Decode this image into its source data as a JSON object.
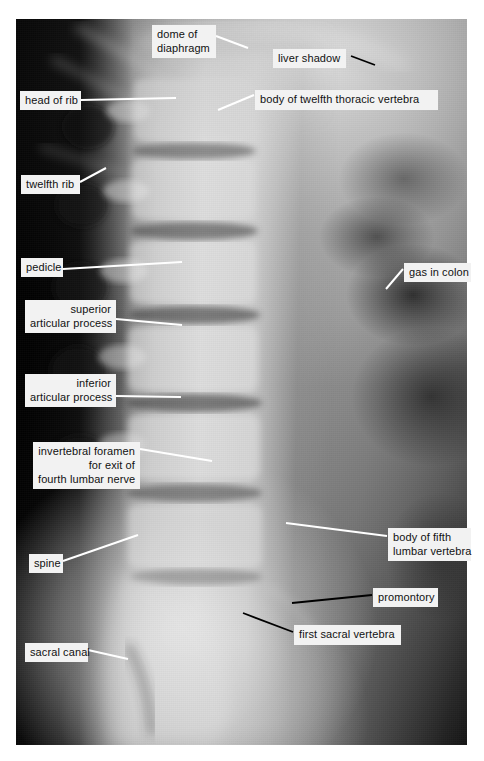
{
  "figure": {
    "kind": "annotated-radiograph",
    "background_color": "#ffffff",
    "label_box_color": "#f2f2f2",
    "label_text_color": "#111111",
    "white_leader_color": "#ffffff",
    "black_leader_color": "#000000"
  },
  "annotations": [
    {
      "id": "dome-of-diaphragm",
      "text": "dome of\ndiaphragm",
      "align": "left",
      "box": {
        "x": 152,
        "y": 25,
        "w": 64,
        "h": 31
      },
      "leader": {
        "from_x": 216,
        "from_y": 36,
        "to_x": 248,
        "to_y": 48,
        "color": "white"
      }
    },
    {
      "id": "liver-shadow",
      "text": "liver shadow",
      "align": "left",
      "box": {
        "x": 273,
        "y": 49,
        "w": 73,
        "h": 19
      },
      "leader": {
        "from_x": 351,
        "from_y": 56,
        "to_x": 375,
        "to_y": 65,
        "color": "black"
      }
    },
    {
      "id": "head-of-rib",
      "text": "head of rib",
      "align": "left",
      "box": {
        "x": 20,
        "y": 91,
        "w": 61,
        "h": 19
      },
      "leader": {
        "from_x": 81,
        "from_y": 100,
        "to_x": 176,
        "to_y": 98,
        "color": "white"
      }
    },
    {
      "id": "body-of-twelfth-thoracic-vertebra",
      "text": "body of twelfth thoracic vertebra",
      "align": "left",
      "box": {
        "x": 255,
        "y": 90,
        "w": 183,
        "h": 20
      },
      "leader": {
        "from_x": 254,
        "from_y": 95,
        "to_x": 218,
        "to_y": 110,
        "color": "white"
      }
    },
    {
      "id": "twelfth-rib",
      "text": "twelfth rib",
      "align": "left",
      "box": {
        "x": 21,
        "y": 175,
        "w": 59,
        "h": 19
      },
      "leader": {
        "from_x": 80,
        "from_y": 182,
        "to_x": 106,
        "to_y": 168,
        "color": "white"
      }
    },
    {
      "id": "pedicle",
      "text": "pedicle",
      "align": "left",
      "box": {
        "x": 21,
        "y": 258,
        "w": 42,
        "h": 19
      },
      "leader": {
        "from_x": 63,
        "from_y": 269,
        "to_x": 182,
        "to_y": 262,
        "color": "white"
      }
    },
    {
      "id": "gas-in-colon",
      "text": "gas in colon",
      "align": "left",
      "box": {
        "x": 404,
        "y": 263,
        "w": 67,
        "h": 19
      },
      "leader": {
        "from_x": 403,
        "from_y": 269,
        "to_x": 386,
        "to_y": 289,
        "color": "white"
      }
    },
    {
      "id": "superior-articular-process",
      "text": "superior\narticular process",
      "align": "right",
      "box": {
        "x": 25,
        "y": 300,
        "w": 91,
        "h": 31
      },
      "leader": {
        "from_x": 116,
        "from_y": 319,
        "to_x": 182,
        "to_y": 325,
        "color": "white"
      }
    },
    {
      "id": "inferior-articular-process",
      "text": "inferior\narticular process",
      "align": "right",
      "box": {
        "x": 25,
        "y": 374,
        "w": 91,
        "h": 31
      },
      "leader": {
        "from_x": 116,
        "from_y": 396,
        "to_x": 181,
        "to_y": 397,
        "color": "white"
      }
    },
    {
      "id": "invertebral-foramen",
      "text": "invertebral foramen\nfor exit of\nfourth lumbar nerve",
      "align": "right",
      "box": {
        "x": 33,
        "y": 442,
        "w": 107,
        "h": 45
      },
      "leader": {
        "from_x": 140,
        "from_y": 449,
        "to_x": 212,
        "to_y": 461,
        "color": "white"
      }
    },
    {
      "id": "body-of-fifth-lumbar-vertebra",
      "text": "body of fifth\nlumbar vertebra",
      "align": "left",
      "box": {
        "x": 388,
        "y": 528,
        "w": 83,
        "h": 31
      },
      "leader": {
        "from_x": 387,
        "from_y": 536,
        "to_x": 286,
        "to_y": 523,
        "color": "white"
      }
    },
    {
      "id": "spine",
      "text": "spine",
      "align": "left",
      "box": {
        "x": 29,
        "y": 554,
        "w": 34,
        "h": 19
      },
      "leader": {
        "from_x": 63,
        "from_y": 561,
        "to_x": 138,
        "to_y": 535,
        "color": "white"
      }
    },
    {
      "id": "promontory",
      "text": "promontory",
      "align": "left",
      "box": {
        "x": 373,
        "y": 588,
        "w": 65,
        "h": 19
      },
      "leader": {
        "from_x": 372,
        "from_y": 595,
        "to_x": 292,
        "to_y": 603,
        "color": "black"
      }
    },
    {
      "id": "first-sacral-vertebra",
      "text": "first sacral vertebra",
      "align": "left",
      "box": {
        "x": 294,
        "y": 625,
        "w": 107,
        "h": 20
      },
      "leader": {
        "from_x": 293,
        "from_y": 632,
        "to_x": 243,
        "to_y": 613,
        "color": "black"
      }
    },
    {
      "id": "sacral-canal",
      "text": "sacral canal",
      "align": "left",
      "box": {
        "x": 25,
        "y": 643,
        "w": 63,
        "h": 19
      },
      "leader": {
        "from_x": 88,
        "from_y": 650,
        "to_x": 128,
        "to_y": 659,
        "color": "white"
      }
    }
  ]
}
